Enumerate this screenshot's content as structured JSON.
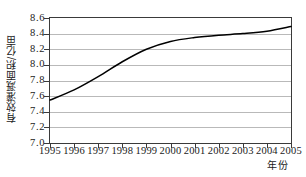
{
  "chart_data": {
    "type": "line",
    "title": "",
    "subtitle": "",
    "xlabel": "年份",
    "ylabel": "有效灌溉面积/亿亩",
    "x": [
      1995,
      1996,
      1997,
      1998,
      1999,
      2000,
      2001,
      2002,
      2003,
      2004,
      2005
    ],
    "xticklabels": [
      "1995",
      "1996",
      "1997",
      "1998",
      "1999",
      "2000",
      "2001",
      "2002",
      "2003",
      "2004",
      "2005"
    ],
    "xlim": [
      1995,
      2005
    ],
    "values": [
      7.55,
      7.68,
      7.85,
      8.04,
      8.2,
      8.3,
      8.35,
      8.38,
      8.4,
      8.43,
      8.49
    ],
    "yticklabels": [
      "7.0",
      "7.2",
      "7.4",
      "7.6",
      "7.8",
      "8.0",
      "8.2",
      "8.4",
      "8.6"
    ],
    "yticks": [
      7.0,
      7.2,
      7.4,
      7.6,
      7.8,
      8.0,
      8.2,
      8.4,
      8.6
    ],
    "ylim": [
      7.0,
      8.6
    ],
    "grid": "horizontal",
    "legend": "none",
    "series": [
      {
        "name": "有效灌溉面积",
        "values": [
          7.55,
          7.68,
          7.85,
          8.04,
          8.2,
          8.3,
          8.35,
          8.38,
          8.4,
          8.43,
          8.49
        ],
        "color": "#000000",
        "style": "smooth-line",
        "markers": "none"
      }
    ],
    "annotations": [],
    "colors": {
      "line": "#000000",
      "gridline": "#b9b9b9",
      "frame": "#3a3a3a",
      "background": "#ffffff",
      "text": "#1a1a1a"
    }
  }
}
